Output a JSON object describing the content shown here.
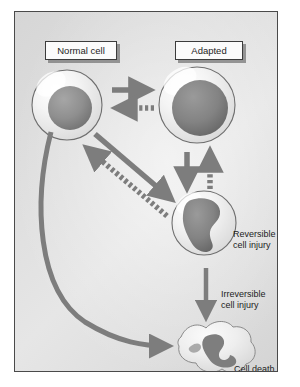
{
  "figure": {
    "background_color": "#dcdcdc",
    "frame_color": "#4a4a4a",
    "arrow_color": "#7a7a7a",
    "nucleus_color": "#8c8c8c",
    "membrane_color": "#f0f0f0"
  },
  "labels": {
    "normal_cell": "Normal cell",
    "adapted": "Adapted",
    "reversible_injury": "Reversible\ncell injury",
    "irreversible_injury": "Irreversible\ncell injury",
    "cell_death": "Cell death"
  },
  "nodes": [
    {
      "id": "normal-cell",
      "label": "Normal cell",
      "shape": "round-cell",
      "x": 66,
      "y": 104
    },
    {
      "id": "adapted-cell",
      "label": "Adapted",
      "shape": "round-cell-large-nucleus",
      "x": 196,
      "y": 104
    },
    {
      "id": "reversible-cell",
      "label": "Reversible cell injury",
      "shape": "round-cell-blob-nucleus",
      "x": 203,
      "y": 222
    },
    {
      "id": "cell-death",
      "label": "Cell death",
      "shape": "irregular-blob",
      "x": 205,
      "y": 340
    }
  ],
  "arrows": [
    {
      "id": "normal-to-adapted",
      "from": "normal-cell",
      "to": "adapted-cell",
      "style": "solid",
      "direction": "right"
    },
    {
      "id": "adapted-to-normal",
      "from": "adapted-cell",
      "to": "normal-cell",
      "style": "dashed",
      "direction": "left"
    },
    {
      "id": "adapted-to-reversible",
      "from": "adapted-cell",
      "to": "reversible-cell",
      "style": "solid",
      "direction": "down"
    },
    {
      "id": "reversible-to-adapted",
      "from": "reversible-cell",
      "to": "adapted-cell",
      "style": "dashed",
      "direction": "up"
    },
    {
      "id": "normal-to-reversible",
      "from": "normal-cell",
      "to": "reversible-cell",
      "style": "solid",
      "direction": "down-right"
    },
    {
      "id": "reversible-to-normal",
      "from": "reversible-cell",
      "to": "normal-cell",
      "style": "dashed",
      "direction": "up-left"
    },
    {
      "id": "reversible-to-death",
      "from": "reversible-cell",
      "to": "cell-death",
      "style": "solid",
      "direction": "down",
      "label": "Irreversible cell injury"
    },
    {
      "id": "normal-to-death",
      "from": "normal-cell",
      "to": "cell-death",
      "style": "solid-curved",
      "direction": "curve-down-right"
    }
  ]
}
